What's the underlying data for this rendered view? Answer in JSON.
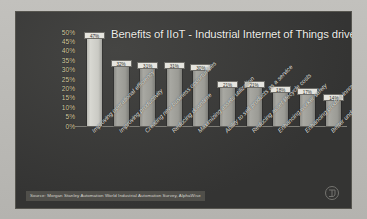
{
  "slide": {
    "background_color": "#3a3a38",
    "frame_color": "#b9b8b4"
  },
  "source_note": "Source: Morgan Stanley Automation World Industrial Automation Survey, AlphaWise",
  "watermark": {
    "name": "circle-monogram-logo"
  },
  "chart_data": {
    "type": "bar",
    "title": "Benefits of IIoT - Industrial Internet of Things drivers",
    "xlabel": "",
    "ylabel": "",
    "ylim": [
      0,
      50
    ],
    "grid": false,
    "legend": "none",
    "ytick_labels": [
      "50%",
      "45%",
      "40%",
      "35%",
      "30%",
      "25%",
      "20%",
      "15%",
      "10%",
      "5%",
      "0%"
    ],
    "ytick_values": [
      50,
      45,
      40,
      35,
      30,
      25,
      20,
      15,
      10,
      5,
      0
    ],
    "categories": [
      "Improving operational efficiency",
      "Improving productivity",
      "Creating new business opportunities",
      "Reducing downtime",
      "Maximizing assets utilization",
      "Ability to sell products as a service",
      "Reducing asset lifecycle costs",
      "Enhancing worker safety",
      "Enhancing product innovation process",
      "Better understanding of customer demand"
    ],
    "values": [
      47,
      32,
      31,
      31,
      30,
      21,
      21,
      18,
      17,
      14
    ],
    "value_labels": [
      "47%",
      "32%",
      "31%",
      "31%",
      "30%",
      "21%",
      "21%",
      "18%",
      "17%",
      "14%"
    ],
    "bar_color": "#9b9b95",
    "highlight_bar_color": "#cacac4",
    "highlight_index": 0
  }
}
